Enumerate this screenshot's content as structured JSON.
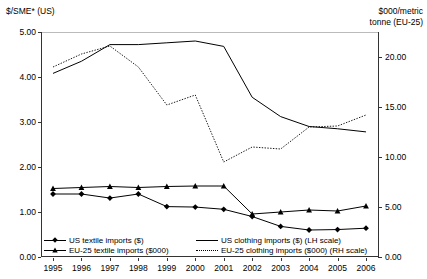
{
  "axes": {
    "left_title": "$/SME* (US)",
    "right_title": "$000/metric\ntonne (EU-25)",
    "left_ticks": [
      "0.00",
      "1.00",
      "2.00",
      "3.00",
      "4.00",
      "5.00"
    ],
    "right_ticks": [
      "0.00",
      "5.00",
      "10.00",
      "15.00",
      "20.00"
    ]
  },
  "legend": {
    "items": [
      {
        "label": "US textile imports ($)",
        "style": "solid-diamond",
        "marker": "diamond-marker"
      },
      {
        "label": "US clothing imports ($) (LH scale)",
        "style": "solid",
        "marker": "none"
      },
      {
        "label": "EU-25 textile imports ($000)",
        "style": "solid-triangle",
        "marker": "triangle-marker"
      },
      {
        "label": "EU-25 clothing imports ($000) (RH scale)",
        "style": "dotted",
        "marker": "none"
      }
    ]
  },
  "chart_data": {
    "type": "line",
    "title": "",
    "xlabel": "",
    "ylabel": "$/SME* (US)",
    "y2label": "$000/metric tonne (EU-25)",
    "grid": false,
    "legend_position": "bottom",
    "ylim": [
      0.0,
      5.0
    ],
    "y2lim": [
      0.0,
      22.5
    ],
    "ytick_values": [
      0.0,
      1.0,
      2.0,
      3.0,
      4.0,
      5.0
    ],
    "y2tick_values": [
      0.0,
      5.0,
      10.0,
      15.0,
      20.0
    ],
    "categories": [
      "1995",
      "1996",
      "1997",
      "1998",
      "1999",
      "2000",
      "2001",
      "2002",
      "2003",
      "2004",
      "2005",
      "2006"
    ],
    "series": [
      {
        "name": "US clothing imports ($) (LH scale)",
        "axis": "left",
        "style": "solid",
        "marker": "none",
        "values": [
          4.08,
          4.35,
          4.72,
          4.72,
          4.76,
          4.8,
          4.68,
          3.55,
          3.12,
          2.9,
          2.85,
          2.78
        ]
      },
      {
        "name": "EU-25 clothing imports ($000) (RH scale)",
        "axis": "right",
        "style": "dotted",
        "marker": "none",
        "values": [
          19.0,
          20.3,
          21.1,
          19.0,
          15.2,
          16.2,
          9.5,
          11.0,
          10.8,
          13.0,
          13.1,
          14.2
        ]
      },
      {
        "name": "US textile imports ($)",
        "axis": "left",
        "style": "solid",
        "marker": "diamond",
        "values": [
          1.4,
          1.4,
          1.31,
          1.4,
          1.12,
          1.11,
          1.06,
          0.9,
          0.68,
          0.6,
          0.61,
          0.64
        ]
      },
      {
        "name": "EU-25 textile imports ($000)",
        "axis": "right",
        "style": "solid",
        "marker": "triangle",
        "values": [
          6.85,
          6.95,
          7.05,
          6.95,
          7.05,
          7.1,
          7.1,
          4.3,
          4.5,
          4.7,
          4.6,
          5.1
        ]
      }
    ]
  },
  "colors": {
    "line": "#000000",
    "axis": "#333333",
    "background": "#ffffff"
  }
}
